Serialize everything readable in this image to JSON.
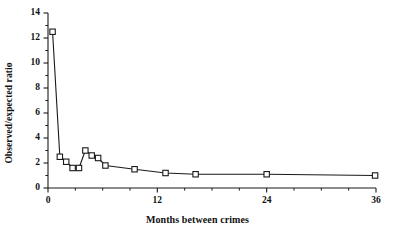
{
  "chart_data": {
    "type": "line",
    "title": "",
    "subtitle": "",
    "xlabel": "Months between  crimes",
    "ylabel": "Observed/expected ratio",
    "xlim": [
      0,
      36
    ],
    "ylim": [
      0,
      14
    ],
    "xticks": [
      0,
      12,
      24,
      36
    ],
    "xtick_labels": [
      "0",
      "12",
      "24",
      "36"
    ],
    "yticks": [
      0,
      2,
      4,
      6,
      8,
      10,
      12,
      14
    ],
    "ytick_labels": [
      "0",
      "2",
      "4",
      "6",
      "8",
      "10",
      "12",
      "14"
    ],
    "x_minor_interval": 3,
    "y_minor_interval": 1,
    "grid": false,
    "legend": null,
    "marker": "open-square",
    "line_color": "#1a1a1a",
    "marker_face_color": "#ffffff",
    "marker_edge_color": "#1a1a1a",
    "series": [
      {
        "name": "Observed/expected ratio",
        "x": [
          0.5,
          1.3,
          2.0,
          2.7,
          3.4,
          4.1,
          4.8,
          5.5,
          6.3,
          9.5,
          12.9,
          16.2,
          24.0,
          35.9
        ],
        "values": [
          12.5,
          2.5,
          2.1,
          1.6,
          1.6,
          3.0,
          2.6,
          2.4,
          1.8,
          1.5,
          1.2,
          1.1,
          1.1,
          1.0
        ]
      }
    ],
    "annotations": []
  },
  "figure": {
    "axis_color": "#1a1a1a",
    "background": "#ffffff"
  }
}
